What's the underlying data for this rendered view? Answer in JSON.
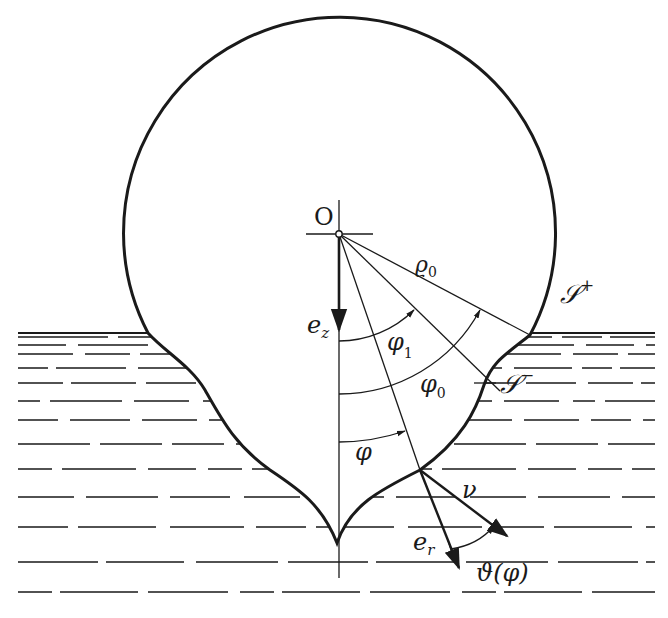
{
  "figure": {
    "colors": {
      "ink": "#1a1a1a",
      "background": "#ffffff"
    },
    "labels": {
      "origin": "O",
      "radius": "ϱ₀",
      "radius_base": "ϱ",
      "radius_sub": "0",
      "surface_upper": "𝒮",
      "surface_upper_sup": "+",
      "surface_lower": "𝒮",
      "surface_lower_sup": "−",
      "ez_base": "e",
      "ez_sub": "z",
      "er_base": "e",
      "er_sub": "r",
      "phi": "φ",
      "phi1_base": "φ",
      "phi1_sub": "1",
      "phi0_base": "φ",
      "phi0_sub": "0",
      "normal": "ν",
      "theta": "ϑ(φ)"
    },
    "elements": [
      "upper spherical cap (circle of radius ϱ₀ centred at O)",
      "liquid region shown with dashed horizontal lines",
      "lower wetted surface ending in a cusp on the symmetry axis",
      "unit vectors e_z, e_r, normal ν",
      "angles φ, φ₁, φ₀ measured from the vertical axis, angle ϑ(φ) between e_r and ν"
    ]
  }
}
